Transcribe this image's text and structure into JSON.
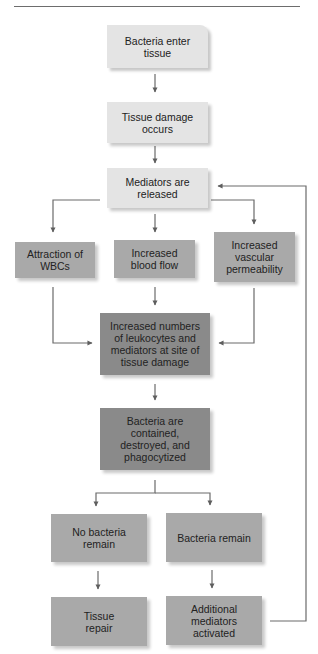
{
  "header": {
    "rule": true
  },
  "diagram": {
    "title": "",
    "nodes": {
      "bacteria_enter": "Bacteria enter tissue",
      "tissue_damage": "Tissue damage occurs",
      "mediators_released": "Mediators are released",
      "attraction_wbcs": "Attraction of WBCs",
      "increased_blood_flow": "Increased blood flow",
      "increased_permeability": "Increased vascular permeability",
      "increased_leukocytes": "Increased numbers of leukocytes and mediators at site of tissue damage",
      "bacteria_contained": "Bacteria are contained, destroyed, and phagocytized",
      "no_bacteria_remain": "No bacteria remain",
      "bacteria_remain": "Bacteria remain",
      "tissue_repair": "Tissue repair",
      "additional_mediators": "Additional mediators activated"
    },
    "edges": [
      [
        "bacteria_enter",
        "tissue_damage"
      ],
      [
        "tissue_damage",
        "mediators_released"
      ],
      [
        "mediators_released",
        "attraction_wbcs"
      ],
      [
        "mediators_released",
        "increased_blood_flow"
      ],
      [
        "mediators_released",
        "increased_permeability"
      ],
      [
        "attraction_wbcs",
        "increased_leukocytes"
      ],
      [
        "increased_blood_flow",
        "increased_leukocytes"
      ],
      [
        "increased_permeability",
        "increased_leukocytes"
      ],
      [
        "increased_leukocytes",
        "bacteria_contained"
      ],
      [
        "bacteria_contained",
        "no_bacteria_remain"
      ],
      [
        "bacteria_contained",
        "bacteria_remain"
      ],
      [
        "no_bacteria_remain",
        "tissue_repair"
      ],
      [
        "bacteria_remain",
        "additional_mediators"
      ],
      [
        "additional_mediators",
        "mediators_released"
      ]
    ],
    "colors": {
      "light": "#e4e4e4",
      "mid": "#a9a9a9",
      "dark": "#8a8a8a",
      "line": "#6b6b6b"
    }
  }
}
